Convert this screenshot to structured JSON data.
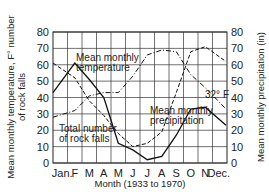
{
  "chart_data": {
    "type": "line",
    "title": "",
    "xlabel": "Month (1933 to 1970)",
    "ylabel_left": "Mean monthly temperature, F° number of rock falls",
    "ylabel_right": "Mean monthly precipitation (in)",
    "ylim": [
      0,
      80
    ],
    "yticks": [
      0,
      10,
      20,
      30,
      40,
      50,
      60,
      70,
      80
    ],
    "categories": [
      "Jan.",
      "F",
      "M",
      "A",
      "M",
      "J",
      "J",
      "A",
      "S",
      "O",
      "N",
      "Dec."
    ],
    "grid": true,
    "legend_position": "inline labels",
    "series": [
      {
        "name": "Mean monthly temperature",
        "style": "dash-dot",
        "values": [
          28,
          32,
          41,
          43,
          43,
          53,
          66,
          69,
          68,
          54,
          46,
          33
        ]
      },
      {
        "name": "Mean monthly precipitation",
        "style": "dashed",
        "values": [
          61,
          52,
          38,
          29,
          18,
          10,
          12,
          19,
          43,
          68,
          71,
          62
        ]
      },
      {
        "name": "Total number of rock falls",
        "style": "solid",
        "values": [
          43,
          61,
          51,
          40,
          12,
          8,
          2,
          4,
          17,
          33,
          34,
          23
        ]
      }
    ],
    "annotations": [
      {
        "text": "Mean monthly temperature",
        "near": "F–M, 60–65"
      },
      {
        "text": "Mean monthly precipitation",
        "near": "J–S, 25–35"
      },
      {
        "text": "Total number of rock falls",
        "near": "Jan.–M, 5–15"
      },
      {
        "text": "32° F",
        "near": "N–Dec., 32"
      }
    ]
  },
  "labels": {
    "temperature": [
      "Mean monthly",
      "temperature"
    ],
    "precipitation": [
      "Mean monthly",
      "precipitation"
    ],
    "rockfalls": [
      "Total number",
      "of rock falls"
    ],
    "freezing": "32° F",
    "xlabel": "Month (1933 to 1970)",
    "ylabel_left": [
      "Mean monthly temperature, F° number",
      "of rock falls"
    ],
    "ylabel_right": "Mean monthly precipitation (in)"
  }
}
